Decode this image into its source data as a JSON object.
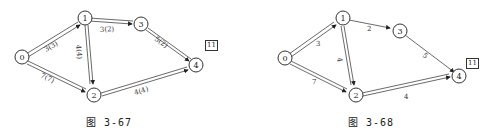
{
  "figures": [
    {
      "caption": "图 3-67",
      "result_box": "11",
      "nodes": [
        "0",
        "1",
        "2",
        "3",
        "4"
      ],
      "edges": [
        {
          "from": "0",
          "to": "1",
          "label": "3(3)"
        },
        {
          "from": "1",
          "to": "3",
          "label": "3(2)"
        },
        {
          "from": "1",
          "to": "2",
          "label": "4(4)"
        },
        {
          "from": "0",
          "to": "2",
          "label": "7(7)"
        },
        {
          "from": "3",
          "to": "4",
          "label": "5(2)"
        },
        {
          "from": "2",
          "to": "4",
          "label": "4(4)"
        }
      ]
    },
    {
      "caption": "图 3-68",
      "result_box": "11",
      "nodes": [
        "0",
        "1",
        "2",
        "3",
        "4"
      ],
      "edges": [
        {
          "from": "0",
          "to": "1",
          "label": "3"
        },
        {
          "from": "1",
          "to": "3",
          "label": "2"
        },
        {
          "from": "1",
          "to": "2",
          "label": "4"
        },
        {
          "from": "0",
          "to": "2",
          "label": "7"
        },
        {
          "from": "3",
          "to": "4",
          "label": "5"
        },
        {
          "from": "2",
          "to": "4",
          "label": "4"
        }
      ]
    }
  ]
}
